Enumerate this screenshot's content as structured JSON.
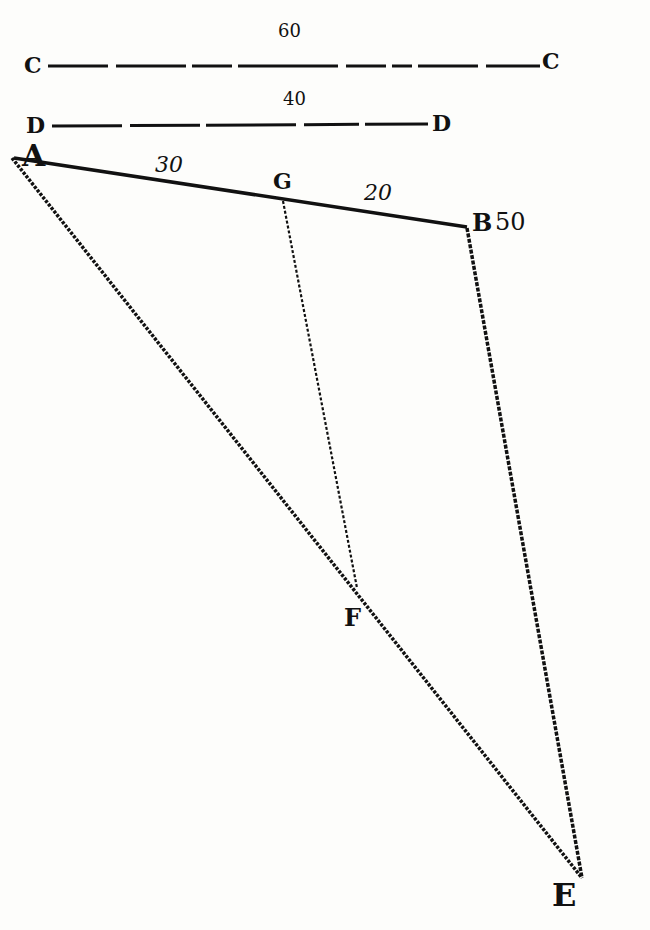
{
  "diagram": {
    "scale_lines": [
      {
        "label_left": "C",
        "label_right": "C",
        "value": "60"
      },
      {
        "label_left": "D",
        "label_right": "D",
        "value": "40"
      }
    ],
    "points": {
      "A": "A",
      "B": "B",
      "E": "E",
      "F": "F",
      "G": "G"
    },
    "segment_labels": {
      "AG": "30",
      "GB": "20",
      "B": "50"
    },
    "colors": {
      "ink": "#111111",
      "paper": "#fdfdfb"
    }
  }
}
